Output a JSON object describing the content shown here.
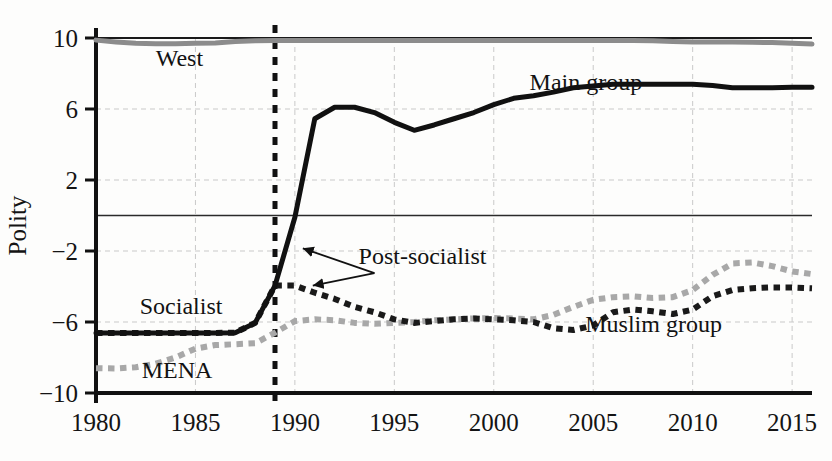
{
  "chart_data": {
    "type": "line",
    "title": "",
    "subtitle": "",
    "xlabel": "",
    "ylabel": "Polity",
    "xlim": [
      1980,
      2016
    ],
    "ylim": [
      -10,
      10
    ],
    "yticks": [
      10,
      6,
      2,
      -2,
      -6,
      -10
    ],
    "ytick_labels": [
      "10",
      "6",
      "2",
      "−2",
      "−6",
      "−10"
    ],
    "xticks": [
      1980,
      1985,
      1990,
      1995,
      2000,
      2005,
      2010,
      2015
    ],
    "xtick_labels": [
      "1980",
      "1985",
      "1990",
      "1995",
      "2000",
      "2005",
      "2010",
      "2015"
    ],
    "grid": true,
    "grid_color": "#c9c9c9",
    "zero_line": 0,
    "legend_position": "inline-annotations",
    "annotations": [
      {
        "text": "West",
        "x": 1983.0,
        "y": 8.45
      },
      {
        "text": "Main group",
        "x": 2001.8,
        "y": 7.05
      },
      {
        "text": "Post-socialist",
        "x": 1993.2,
        "y": -2.75
      },
      {
        "text": "Socialist",
        "x": 1982.2,
        "y": -5.55
      },
      {
        "text": "MENA",
        "x": 1982.3,
        "y": -9.15
      },
      {
        "text": "Muslim group",
        "x": 2004.6,
        "y": -6.55
      }
    ],
    "arrows": [
      {
        "from_x": 1994.0,
        "from_y": -3.25,
        "to_x": 1990.4,
        "to_y": -1.85
      },
      {
        "from_x": 1994.0,
        "from_y": -3.25,
        "to_x": 1990.9,
        "to_y": -3.95
      }
    ],
    "vline": {
      "x": 1989,
      "style": "dashed",
      "color": "#111111"
    },
    "x": [
      1980,
      1981,
      1982,
      1983,
      1984,
      1985,
      1986,
      1987,
      1988,
      1989,
      1990,
      1991,
      1992,
      1993,
      1994,
      1995,
      1996,
      1997,
      1998,
      1999,
      2000,
      2001,
      2002,
      2003,
      2004,
      2005,
      2006,
      2007,
      2008,
      2009,
      2010,
      2011,
      2012,
      2013,
      2014,
      2015,
      2016
    ],
    "series": [
      {
        "name": "West",
        "color": "#8c8c8c",
        "style": "solid",
        "width": 5,
        "values": [
          9.88,
          9.78,
          9.7,
          9.68,
          9.68,
          9.7,
          9.72,
          9.8,
          9.85,
          9.86,
          9.86,
          9.86,
          9.86,
          9.86,
          9.86,
          9.86,
          9.86,
          9.86,
          9.86,
          9.86,
          9.86,
          9.86,
          9.86,
          9.86,
          9.86,
          9.86,
          9.86,
          9.86,
          9.84,
          9.8,
          9.78,
          9.78,
          9.78,
          9.76,
          9.74,
          9.7,
          9.66
        ]
      },
      {
        "name": "Main group",
        "color": "#111111",
        "style": "solid",
        "width": 5,
        "values": [
          -6.62,
          -6.62,
          -6.62,
          -6.62,
          -6.62,
          -6.62,
          -6.62,
          -6.6,
          -6.05,
          -3.95,
          -0.1,
          5.45,
          6.1,
          6.1,
          5.8,
          5.25,
          4.8,
          5.1,
          5.45,
          5.8,
          6.25,
          6.6,
          6.75,
          6.95,
          7.2,
          7.3,
          7.4,
          7.4,
          7.4,
          7.4,
          7.4,
          7.32,
          7.2,
          7.2,
          7.2,
          7.22,
          7.22
        ]
      },
      {
        "name": "Muslim group",
        "color": "#1a1a1a",
        "style": "dotted",
        "width": 6,
        "values": [
          -6.62,
          -6.62,
          -6.62,
          -6.62,
          -6.62,
          -6.62,
          -6.62,
          -6.6,
          -6.05,
          -3.95,
          -3.95,
          -4.35,
          -4.7,
          -5.15,
          -5.45,
          -5.85,
          -6.05,
          -5.95,
          -5.85,
          -5.8,
          -5.85,
          -5.9,
          -6.0,
          -6.35,
          -6.45,
          -6.2,
          -5.45,
          -5.3,
          -5.4,
          -5.55,
          -5.3,
          -4.55,
          -4.2,
          -4.1,
          -4.05,
          -4.05,
          -4.1
        ]
      },
      {
        "name": "MENA",
        "color": "#a8a8a8",
        "style": "dotted",
        "width": 6,
        "values": [
          -8.6,
          -8.62,
          -8.55,
          -8.35,
          -8.0,
          -7.5,
          -7.3,
          -7.25,
          -7.2,
          -6.6,
          -5.95,
          -5.85,
          -5.9,
          -6.05,
          -6.1,
          -6.05,
          -6.0,
          -5.9,
          -5.85,
          -5.8,
          -5.78,
          -5.8,
          -5.85,
          -5.6,
          -5.15,
          -4.75,
          -4.6,
          -4.55,
          -4.65,
          -4.6,
          -4.2,
          -3.35,
          -2.7,
          -2.65,
          -2.85,
          -3.15,
          -3.3
        ]
      }
    ]
  }
}
